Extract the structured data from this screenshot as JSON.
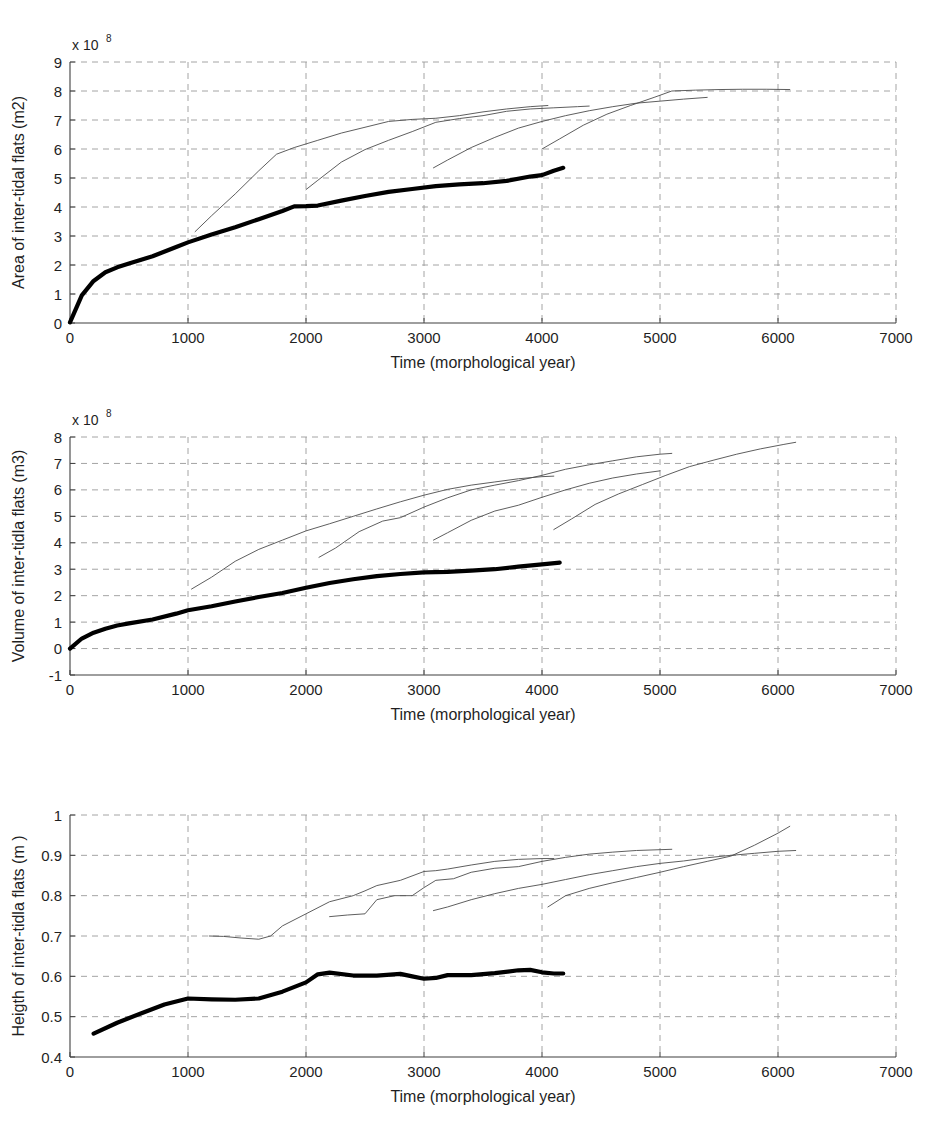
{
  "figure": {
    "caption_fragment": ""
  },
  "chart_data": [
    {
      "type": "line",
      "title": "",
      "xlabel": "Time (morphological year)",
      "ylabel": "Area of inter-tidal flats (m2)",
      "y_multiplier": "x 10",
      "y_multiplier_exp": "8",
      "xlim": [
        0,
        7000
      ],
      "ylim": [
        0,
        9
      ],
      "xticks": [
        0,
        1000,
        2000,
        3000,
        4000,
        5000,
        6000,
        7000
      ],
      "yticks": [
        0,
        1,
        2,
        3,
        4,
        5,
        6,
        7,
        8,
        9
      ],
      "grid": true,
      "legend": "none",
      "series": [
        {
          "name": "base-run-thick",
          "style": "thick",
          "x": [
            0,
            100,
            200,
            300,
            400,
            500,
            700,
            900,
            1000,
            1200,
            1400,
            1600,
            1800,
            1900,
            2000,
            2100,
            2300,
            2500,
            2700,
            2900,
            3100,
            3300,
            3500,
            3700,
            3900,
            4000,
            4100,
            4180
          ],
          "y": [
            0.02,
            0.95,
            1.45,
            1.75,
            1.92,
            2.05,
            2.3,
            2.62,
            2.78,
            3.05,
            3.3,
            3.58,
            3.86,
            4.02,
            4.03,
            4.05,
            4.22,
            4.38,
            4.52,
            4.62,
            4.72,
            4.78,
            4.82,
            4.9,
            5.05,
            5.1,
            5.25,
            5.35
          ]
        },
        {
          "name": "restart-run-1",
          "style": "thin",
          "x": [
            1060,
            1200,
            1400,
            1600,
            1750,
            1900,
            2100,
            2300,
            2500,
            2700,
            2900,
            3100,
            3300,
            3500,
            3700,
            3900,
            4050
          ],
          "y": [
            3.15,
            3.7,
            4.45,
            5.25,
            5.82,
            6.05,
            6.3,
            6.55,
            6.75,
            6.95,
            7.02,
            7.06,
            7.15,
            7.28,
            7.38,
            7.46,
            7.5
          ]
        },
        {
          "name": "restart-run-2",
          "style": "thin",
          "x": [
            2000,
            2100,
            2300,
            2500,
            2700,
            2900,
            3100,
            3300,
            3500,
            3700,
            3900,
            4100,
            4300,
            4400
          ],
          "y": [
            4.6,
            4.92,
            5.55,
            5.98,
            6.3,
            6.6,
            6.92,
            7.05,
            7.15,
            7.3,
            7.38,
            7.42,
            7.46,
            7.48
          ]
        },
        {
          "name": "restart-run-3",
          "style": "thin",
          "x": [
            3080,
            3200,
            3400,
            3600,
            3800,
            4000,
            4200,
            4400,
            4600,
            4800,
            5000,
            5200,
            5400
          ],
          "y": [
            5.35,
            5.62,
            6.05,
            6.4,
            6.72,
            6.95,
            7.15,
            7.32,
            7.46,
            7.58,
            7.65,
            7.72,
            7.78
          ]
        },
        {
          "name": "restart-run-4",
          "style": "thin",
          "x": [
            4000,
            4150,
            4350,
            4550,
            4750,
            4950,
            5100,
            5300,
            5500,
            5700,
            5900,
            6100
          ],
          "y": [
            6.0,
            6.35,
            6.82,
            7.2,
            7.5,
            7.78,
            8.0,
            8.03,
            8.05,
            8.06,
            8.06,
            8.05
          ]
        }
      ]
    },
    {
      "type": "line",
      "title": "",
      "xlabel": "Time (morphological year)",
      "ylabel": "Volume of inter-tidla flats (m3)",
      "y_multiplier": "x 10",
      "y_multiplier_exp": "8",
      "xlim": [
        0,
        7000
      ],
      "ylim": [
        -1,
        8
      ],
      "xticks": [
        0,
        1000,
        2000,
        3000,
        4000,
        5000,
        6000,
        7000
      ],
      "yticks": [
        -1,
        0,
        1,
        2,
        3,
        4,
        5,
        6,
        7,
        8
      ],
      "grid": true,
      "legend": "none",
      "series": [
        {
          "name": "base-run-thick",
          "style": "thick",
          "x": [
            0,
            100,
            200,
            300,
            400,
            500,
            700,
            900,
            1000,
            1200,
            1400,
            1600,
            1800,
            2000,
            2200,
            2400,
            2600,
            2800,
            3000,
            3200,
            3400,
            3600,
            3800,
            4000,
            4150
          ],
          "y": [
            0.0,
            0.38,
            0.6,
            0.75,
            0.87,
            0.95,
            1.1,
            1.32,
            1.45,
            1.6,
            1.78,
            1.95,
            2.1,
            2.3,
            2.48,
            2.62,
            2.74,
            2.82,
            2.88,
            2.9,
            2.95,
            3.0,
            3.1,
            3.18,
            3.25
          ]
        },
        {
          "name": "restart-run-1",
          "style": "thin",
          "x": [
            1030,
            1200,
            1400,
            1600,
            1800,
            2000,
            2200,
            2400,
            2600,
            2800,
            3000,
            3200,
            3400,
            3600,
            3800,
            4000,
            4100
          ],
          "y": [
            2.25,
            2.7,
            3.3,
            3.75,
            4.1,
            4.45,
            4.72,
            5.0,
            5.28,
            5.55,
            5.8,
            6.02,
            6.18,
            6.3,
            6.42,
            6.5,
            6.52
          ]
        },
        {
          "name": "restart-run-2",
          "style": "thin",
          "x": [
            2110,
            2250,
            2450,
            2650,
            2800,
            3000,
            3200,
            3400,
            3600,
            3800,
            4000,
            4200,
            4400,
            4600,
            4800,
            5000,
            5100
          ],
          "y": [
            3.45,
            3.8,
            4.42,
            4.82,
            4.95,
            5.35,
            5.7,
            6.0,
            6.18,
            6.35,
            6.55,
            6.78,
            6.95,
            7.1,
            7.25,
            7.35,
            7.38
          ]
        },
        {
          "name": "restart-run-3",
          "style": "thin",
          "x": [
            3080,
            3200,
            3400,
            3600,
            3800,
            4000,
            4200,
            4400,
            4600,
            4800,
            5000
          ],
          "y": [
            4.1,
            4.38,
            4.85,
            5.2,
            5.42,
            5.72,
            6.0,
            6.25,
            6.45,
            6.6,
            6.72
          ]
        },
        {
          "name": "restart-run-4",
          "style": "thin",
          "x": [
            4100,
            4250,
            4450,
            4650,
            4850,
            5050,
            5250,
            5450,
            5650,
            5850,
            6050,
            6150
          ],
          "y": [
            4.5,
            4.9,
            5.45,
            5.85,
            6.2,
            6.55,
            6.88,
            7.12,
            7.35,
            7.55,
            7.72,
            7.8
          ]
        }
      ]
    },
    {
      "type": "line",
      "title": "",
      "xlabel": "Time (morphological year)",
      "ylabel": "Heigth of inter-tidla flats (m )",
      "y_multiplier": "",
      "y_multiplier_exp": "",
      "xlim": [
        0,
        7000
      ],
      "ylim": [
        0.4,
        1.0
      ],
      "xticks": [
        0,
        1000,
        2000,
        3000,
        4000,
        5000,
        6000,
        7000
      ],
      "yticks": [
        0.4,
        0.5,
        0.6,
        0.7,
        0.8,
        0.9,
        1.0
      ],
      "ytick_labels": [
        "0.4",
        "0.5",
        "0.6",
        "0.7",
        "0.8",
        "0.9",
        "1"
      ],
      "grid": true,
      "legend": "none",
      "series": [
        {
          "name": "base-run-thick",
          "style": "thick",
          "x": [
            200,
            400,
            600,
            800,
            1000,
            1200,
            1400,
            1600,
            1800,
            2000,
            2100,
            2200,
            2400,
            2600,
            2800,
            2900,
            3000,
            3100,
            3200,
            3400,
            3600,
            3800,
            3900,
            4000,
            4100,
            4180
          ],
          "y": [
            0.458,
            0.485,
            0.508,
            0.53,
            0.545,
            0.543,
            0.542,
            0.545,
            0.562,
            0.585,
            0.605,
            0.609,
            0.602,
            0.602,
            0.606,
            0.6,
            0.594,
            0.596,
            0.603,
            0.603,
            0.608,
            0.615,
            0.616,
            0.61,
            0.607,
            0.607
          ]
        },
        {
          "name": "restart-run-1",
          "style": "thin",
          "x": [
            1180,
            1300,
            1450,
            1600,
            1700,
            1800,
            2000,
            2200,
            2400,
            2500,
            2600,
            2800,
            3000,
            3100,
            3200,
            3400,
            3600,
            3800,
            4000,
            4100
          ],
          "y": [
            0.7,
            0.699,
            0.695,
            0.692,
            0.7,
            0.725,
            0.755,
            0.785,
            0.8,
            0.812,
            0.825,
            0.838,
            0.86,
            0.862,
            0.866,
            0.876,
            0.885,
            0.89,
            0.892,
            0.892
          ]
        },
        {
          "name": "restart-run-2",
          "style": "thin",
          "x": [
            2200,
            2350,
            2500,
            2600,
            2750,
            2900,
            3000,
            3100,
            3250,
            3400,
            3600,
            3800,
            4000,
            4200,
            4400,
            4600,
            4800,
            5000,
            5100
          ],
          "y": [
            0.748,
            0.752,
            0.755,
            0.79,
            0.8,
            0.8,
            0.82,
            0.838,
            0.842,
            0.858,
            0.868,
            0.872,
            0.885,
            0.895,
            0.903,
            0.908,
            0.912,
            0.914,
            0.915
          ]
        },
        {
          "name": "restart-run-3",
          "style": "thin",
          "x": [
            3080,
            3200,
            3400,
            3600,
            3800,
            4000,
            4200,
            4400,
            4600,
            4800,
            5000,
            5200,
            5400,
            5600,
            5800,
            6000,
            6150
          ],
          "y": [
            0.763,
            0.772,
            0.79,
            0.805,
            0.818,
            0.828,
            0.84,
            0.852,
            0.862,
            0.872,
            0.88,
            0.886,
            0.894,
            0.9,
            0.905,
            0.91,
            0.912
          ]
        },
        {
          "name": "restart-run-4",
          "style": "thin",
          "x": [
            4050,
            4200,
            4400,
            4600,
            4800,
            5000,
            5200,
            5400,
            5600,
            5800,
            6000,
            6100
          ],
          "y": [
            0.772,
            0.8,
            0.818,
            0.832,
            0.845,
            0.858,
            0.872,
            0.885,
            0.898,
            0.925,
            0.955,
            0.972
          ]
        }
      ]
    }
  ],
  "colors": {
    "axis": "#3f3f3f",
    "grid": "#9a9a9a",
    "thick_line": "#000000",
    "thin_line": "#4c4c4c",
    "text": "#1f1f1f",
    "background": "#ffffff"
  }
}
